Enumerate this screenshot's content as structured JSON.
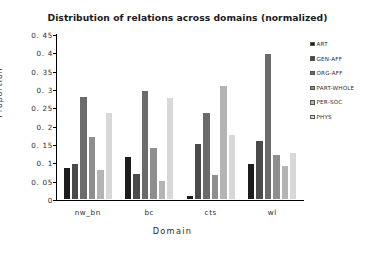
{
  "chart_data": {
    "type": "bar",
    "title": "Distribution of relations across domains (normalized)",
    "xlabel": "Domain",
    "ylabel": "Proportion",
    "categories": [
      "nw_bn",
      "bc",
      "cts",
      "wl"
    ],
    "ylim": [
      0,
      0.45
    ],
    "ytick_labels": [
      "0",
      "0. 05",
      "0. 1",
      "0. 15",
      "0. 2",
      "0. 25",
      "0. 3",
      "0. 35",
      "0. 4",
      "0. 45"
    ],
    "ytick_values": [
      0,
      0.05,
      0.1,
      0.15,
      0.2,
      0.25,
      0.3,
      0.35,
      0.4,
      0.45
    ],
    "grid": false,
    "legend_position": "right",
    "series": [
      {
        "name": "ART",
        "color": "#1c1c1c",
        "values": [
          0.09,
          0.12,
          0.015,
          0.1
        ]
      },
      {
        "name": "GEN-AFF",
        "color": "#4a4a4a",
        "values": [
          0.1,
          0.075,
          0.155,
          0.165
        ]
      },
      {
        "name": "ORG-AFF",
        "color": "#6b6b6b",
        "values": [
          0.285,
          0.3,
          0.24,
          0.4
        ]
      },
      {
        "name": "PART-WHOLE",
        "color": "#8e8e8e",
        "values": [
          0.175,
          0.145,
          0.07,
          0.125
        ]
      },
      {
        "name": "PER-SOC",
        "color": "#b4b4b4",
        "values": [
          0.085,
          0.055,
          0.315,
          0.095
        ]
      },
      {
        "name": "PHYS",
        "color": "#d8d8d8",
        "values": [
          0.24,
          0.28,
          0.18,
          0.13
        ]
      }
    ]
  }
}
